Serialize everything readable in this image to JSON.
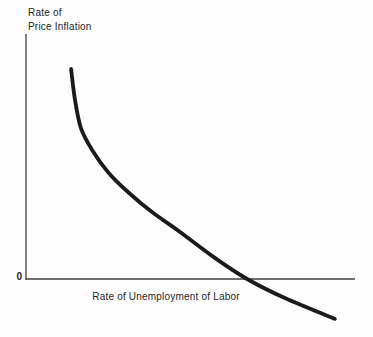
{
  "figure": {
    "y_axis_label_line1": "Rate of",
    "y_axis_label_line2": "Price Inflation",
    "x_axis_label": "Rate of Unemployment of Labor",
    "origin_label": "0",
    "colors": {
      "background": "#fdfdfd",
      "curve": "#1b1b1b",
      "axis": "#3e3e3e",
      "text": "#1f1f1f"
    }
  },
  "chart_data": {
    "type": "line",
    "title": "",
    "xlabel": "Rate of Unemployment of Labor",
    "ylabel": "Rate of Price Inflation",
    "xlim": [
      0,
      10
    ],
    "ylim": [
      0,
      10
    ],
    "grid": false,
    "legend": false,
    "axis_tick_labels": [
      "0"
    ],
    "series": [
      {
        "name": "curve",
        "x": [
          1.37,
          1.49,
          1.67,
          2.01,
          2.49,
          3.1,
          3.83,
          4.68,
          5.74,
          6.72,
          7.87,
          9.39
        ],
        "y": [
          8.57,
          7.31,
          6.16,
          5.27,
          4.37,
          3.55,
          2.73,
          1.92,
          0.86,
          0.0,
          -0.78,
          -1.63
        ]
      }
    ]
  }
}
